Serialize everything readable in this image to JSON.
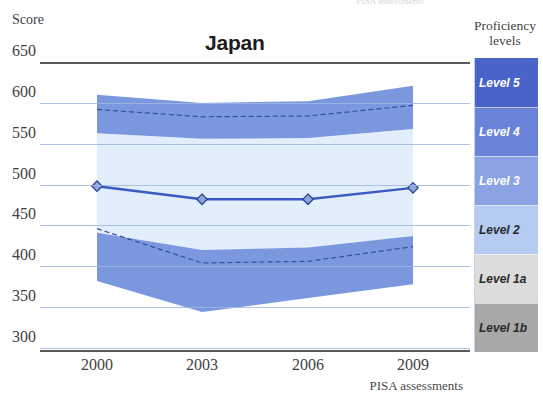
{
  "chart_data": {
    "type": "area",
    "title": "Japan",
    "subtitle": "",
    "xlabel": "PISA assessments",
    "ylabel": "Score",
    "categories": [
      "2000",
      "2003",
      "2006",
      "2009"
    ],
    "x": [
      2000,
      2003,
      2006,
      2009
    ],
    "ylim": [
      295,
      655
    ],
    "yticks": [
      650,
      600,
      550,
      500,
      450,
      400,
      350,
      300
    ],
    "grid": true,
    "legend_position": "right",
    "series": [
      {
        "name": "Mean score",
        "type": "line",
        "marker": "diamond",
        "color": "#3a5bbf",
        "values": [
          498,
          482,
          482,
          496
        ]
      },
      {
        "name": "75th to 95th percentile band",
        "type": "band",
        "color": "#7b97dd",
        "lower": [
          563,
          556,
          557,
          568
        ],
        "upper": [
          610,
          600,
          602,
          621
        ]
      },
      {
        "name": "25th to 75th percentile range",
        "type": "band",
        "color": "#e2eefb",
        "lower": [
          441,
          420,
          423,
          437
        ],
        "upper": [
          563,
          556,
          557,
          568
        ]
      },
      {
        "name": "5th to 25th percentile band",
        "type": "band",
        "color": "#7b97dd",
        "lower": [
          382,
          344,
          361,
          378
        ],
        "upper": [
          441,
          420,
          423,
          437
        ]
      },
      {
        "name": "75th percentile (dashed)",
        "type": "dashed-line",
        "color": "#2f4f9e",
        "values": [
          592,
          583,
          584,
          597
        ]
      },
      {
        "name": "25th percentile (dashed)",
        "type": "dashed-line",
        "color": "#2f4f9e",
        "values": [
          446,
          404,
          406,
          424
        ]
      }
    ]
  },
  "top_caption_remnant": "PISA assessments",
  "axes": {
    "y_title": "Score",
    "x_title": "PISA assessments",
    "y_ticks": [
      "650",
      "600",
      "550",
      "500",
      "450",
      "400",
      "350",
      "300"
    ],
    "x_ticks": [
      "2000",
      "2003",
      "2006",
      "2009"
    ]
  },
  "legend": {
    "title_line1": "Proficiency",
    "title_line2": "levels",
    "items": [
      {
        "label": "Level 5",
        "color": "#4a63c8",
        "text_color": "#ffffff"
      },
      {
        "label": "Level 4",
        "color": "#6a83d8",
        "text_color": "#ffffff"
      },
      {
        "label": "Level 3",
        "color": "#8ba3e4",
        "text_color": "#ffffff"
      },
      {
        "label": "Level 2",
        "color": "#b5cbf2",
        "text_color": "#2a2a2a"
      },
      {
        "label": "Level 1a",
        "color": "#dcdcdc",
        "text_color": "#2a2a2a"
      },
      {
        "label": "Level 1b",
        "color": "#a8a8a8",
        "text_color": "#2a2a2a"
      }
    ]
  },
  "colors": {
    "band_outer": "#7b97dd",
    "band_inner": "#e2eefb",
    "mean_line": "#3a5bbf",
    "gridline": "#9db6e2",
    "axis": "#5a5a5a",
    "text": "#3f3f3f"
  }
}
